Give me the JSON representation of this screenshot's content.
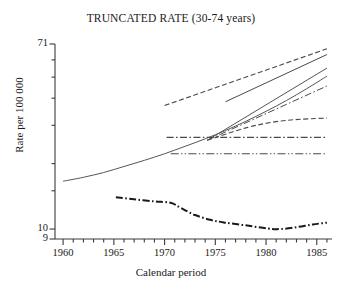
{
  "chart_data": {
    "type": "line",
    "title": "TRUNCATED RATE (30-74 years)",
    "xlabel": "Calendar period",
    "ylabel": "Rate per 100 000",
    "yscale": "log",
    "ylim": [
      9,
      71
    ],
    "xlim": [
      1959.2,
      1986.5
    ],
    "grid": false,
    "legend": "none",
    "ytick_labels": [
      "71",
      "10",
      "9"
    ],
    "ytick_values": [
      71,
      10,
      9
    ],
    "yminor_values": [
      60,
      50,
      40,
      30,
      20,
      15
    ],
    "xtick_labels": [
      "1960",
      "1965",
      "1970",
      "1975",
      "1980",
      "1985"
    ],
    "xtick_values": [
      1960,
      1965,
      1970,
      1975,
      1980,
      1985
    ],
    "xminor_step": 1,
    "series": [
      {
        "name": "observed-trend-solid",
        "style": "solid",
        "width": 1.0,
        "color": "#555555",
        "x": [
          1960,
          1962,
          1964,
          1966,
          1968,
          1970,
          1972,
          1974,
          1976,
          1978,
          1980,
          1982,
          1984,
          1986
        ],
        "values": [
          16.6,
          17.3,
          18.2,
          19.4,
          20.7,
          22.2,
          24.0,
          26.0,
          28.4,
          31.3,
          34.8,
          39.0,
          44.2,
          50.5
        ]
      },
      {
        "name": "projection-upper-dashed",
        "style": "dashed",
        "width": 1.1,
        "color": "#4a4a4a",
        "x": [
          1970,
          1986
        ],
        "values": [
          37.0,
          67.5
        ]
      },
      {
        "name": "projection-upper-solid",
        "style": "solid",
        "width": 1.0,
        "color": "#4a4a4a",
        "x": [
          1976,
          1986
        ],
        "values": [
          38.5,
          63.5
        ]
      },
      {
        "name": "projection-steep-solid",
        "style": "solid",
        "width": 1.0,
        "color": "#555555",
        "x": [
          1974.2,
          1986
        ],
        "values": [
          25.6,
          55.0
        ]
      },
      {
        "name": "projection-steep-dashdot",
        "style": "dashdot",
        "width": 1.0,
        "color": "#4a4a4a",
        "x": [
          1974.2,
          1986
        ],
        "values": [
          25.6,
          45.5
        ]
      },
      {
        "name": "projection-flat-dashed",
        "style": "dashed",
        "width": 1.1,
        "color": "#4a4a4a",
        "x": [
          1974.2,
          1978,
          1981,
          1983.5,
          1986
        ],
        "values": [
          25.6,
          29.2,
          31.2,
          32.0,
          32.4
        ]
      },
      {
        "name": "projection-horizontal-dashdot",
        "style": "dashdot",
        "width": 1.1,
        "color": "#4a4a4a",
        "x": [
          1970.2,
          1986
        ],
        "values": [
          26.4,
          26.4
        ]
      },
      {
        "name": "projection-horizontal-dashdotdot",
        "style": "dashdotdot",
        "width": 1.1,
        "color": "#4a4a4a",
        "x": [
          1970.6,
          1986
        ],
        "values": [
          22.2,
          22.2
        ]
      },
      {
        "name": "observed-rate-thick-dashdot",
        "style": "dashdot",
        "width": 2.0,
        "color": "#1a1a1a",
        "x": [
          1965.2,
          1967,
          1969,
          1970.6,
          1971.6,
          1973,
          1974.6,
          1976,
          1978,
          1980.2,
          1981.4,
          1983,
          1984.6,
          1986
        ],
        "values": [
          14.0,
          13.7,
          13.4,
          13.2,
          12.5,
          11.6,
          11.0,
          10.7,
          10.4,
          10.05,
          10.0,
          10.2,
          10.5,
          10.7
        ]
      }
    ]
  }
}
